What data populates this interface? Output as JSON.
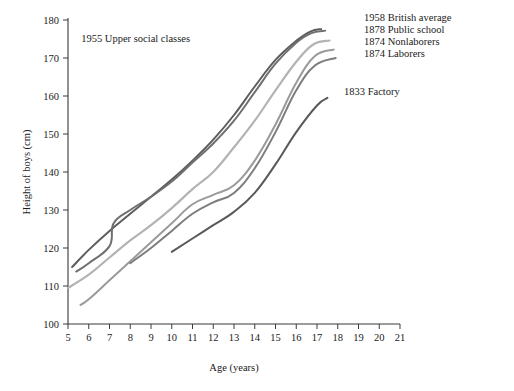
{
  "chart_data": {
    "type": "line",
    "title": "",
    "xlabel": "Age (years)",
    "ylabel": "Height of boys (cm)",
    "xlim": [
      5,
      21
    ],
    "ylim": [
      100,
      180
    ],
    "xticks": [
      5,
      6,
      7,
      8,
      9,
      10,
      11,
      12,
      13,
      14,
      15,
      16,
      17,
      18,
      19,
      20,
      21
    ],
    "yticks": [
      100,
      110,
      120,
      130,
      140,
      150,
      160,
      170,
      180
    ],
    "grid": false,
    "legend_position": "inline-right",
    "series": [
      {
        "name": "1958 British average",
        "label": "1958 British average",
        "color": "#5d5d5d",
        "width": 2.0,
        "label_x": 364,
        "label_y": 21,
        "x": [
          5.2,
          6,
          7,
          8,
          9,
          10,
          11,
          12,
          13,
          14,
          15,
          16,
          16.7,
          17.2
        ],
        "y": [
          115.0,
          119.5,
          124.5,
          129.0,
          133.5,
          138.0,
          143.0,
          148.5,
          155.0,
          162.5,
          169.5,
          174.5,
          177.0,
          177.6
        ]
      },
      {
        "name": "1955 Upper social classes",
        "label": "1955 Upper social classes",
        "color": "#6f6f6f",
        "width": 2.0,
        "label_x": 190,
        "label_y": 42,
        "x": [
          5.4,
          6,
          7,
          7.2,
          8,
          9,
          10,
          11,
          12,
          13,
          14,
          15,
          16,
          16.7,
          17.4
        ],
        "y": [
          113.8,
          116.0,
          120.5,
          126.5,
          130.0,
          133.5,
          137.5,
          142.5,
          147.5,
          153.5,
          161.0,
          168.5,
          174.0,
          176.5,
          177.2
        ]
      },
      {
        "name": "1878 Public school",
        "label": "1878 Public school",
        "color": "#b3b3b3",
        "width": 2.2,
        "label_x": 364,
        "label_y": 33,
        "x": [
          5.0,
          6,
          7,
          8,
          9,
          10,
          11,
          12,
          13,
          14,
          15,
          16,
          16.8,
          17.6
        ],
        "y": [
          109.5,
          113.0,
          117.5,
          122.0,
          126.0,
          130.5,
          135.5,
          140.0,
          146.5,
          153.5,
          161.5,
          169.0,
          173.5,
          174.6
        ]
      },
      {
        "name": "1874 Nonlaborers",
        "label": "1874 Nonlaborers",
        "color": "#9a9a9a",
        "width": 2.0,
        "label_x": 364,
        "label_y": 45,
        "x": [
          5.6,
          6,
          7,
          8,
          9,
          10,
          11,
          12,
          13,
          14,
          15,
          16,
          16.9,
          17.8
        ],
        "y": [
          105.0,
          106.5,
          111.5,
          116.5,
          121.5,
          126.5,
          131.5,
          134.0,
          136.5,
          143.0,
          152.5,
          163.5,
          170.5,
          172.2
        ]
      },
      {
        "name": "1874 Laborers",
        "label": "1874 Laborers",
        "color": "#7d7d7d",
        "width": 2.0,
        "label_x": 364,
        "label_y": 57,
        "x": [
          8.0,
          9,
          10,
          11,
          12,
          13,
          14,
          15,
          16,
          16.9,
          17.9
        ],
        "y": [
          116.0,
          120.0,
          124.5,
          129.0,
          132.0,
          134.5,
          141.0,
          150.5,
          161.5,
          168.0,
          170.0
        ]
      },
      {
        "name": "1833 Factory",
        "label": "1833 Factory",
        "color": "#595959",
        "width": 2.0,
        "label_x": 344,
        "label_y": 95,
        "x": [
          10.0,
          11,
          12,
          13,
          14,
          15,
          16,
          17,
          17.5
        ],
        "y": [
          119.0,
          122.5,
          126.0,
          129.5,
          134.5,
          142.0,
          150.5,
          157.5,
          159.5
        ]
      }
    ]
  },
  "axes": {
    "x_label": "Age (years)",
    "y_label": "Height of boys (cm)"
  }
}
